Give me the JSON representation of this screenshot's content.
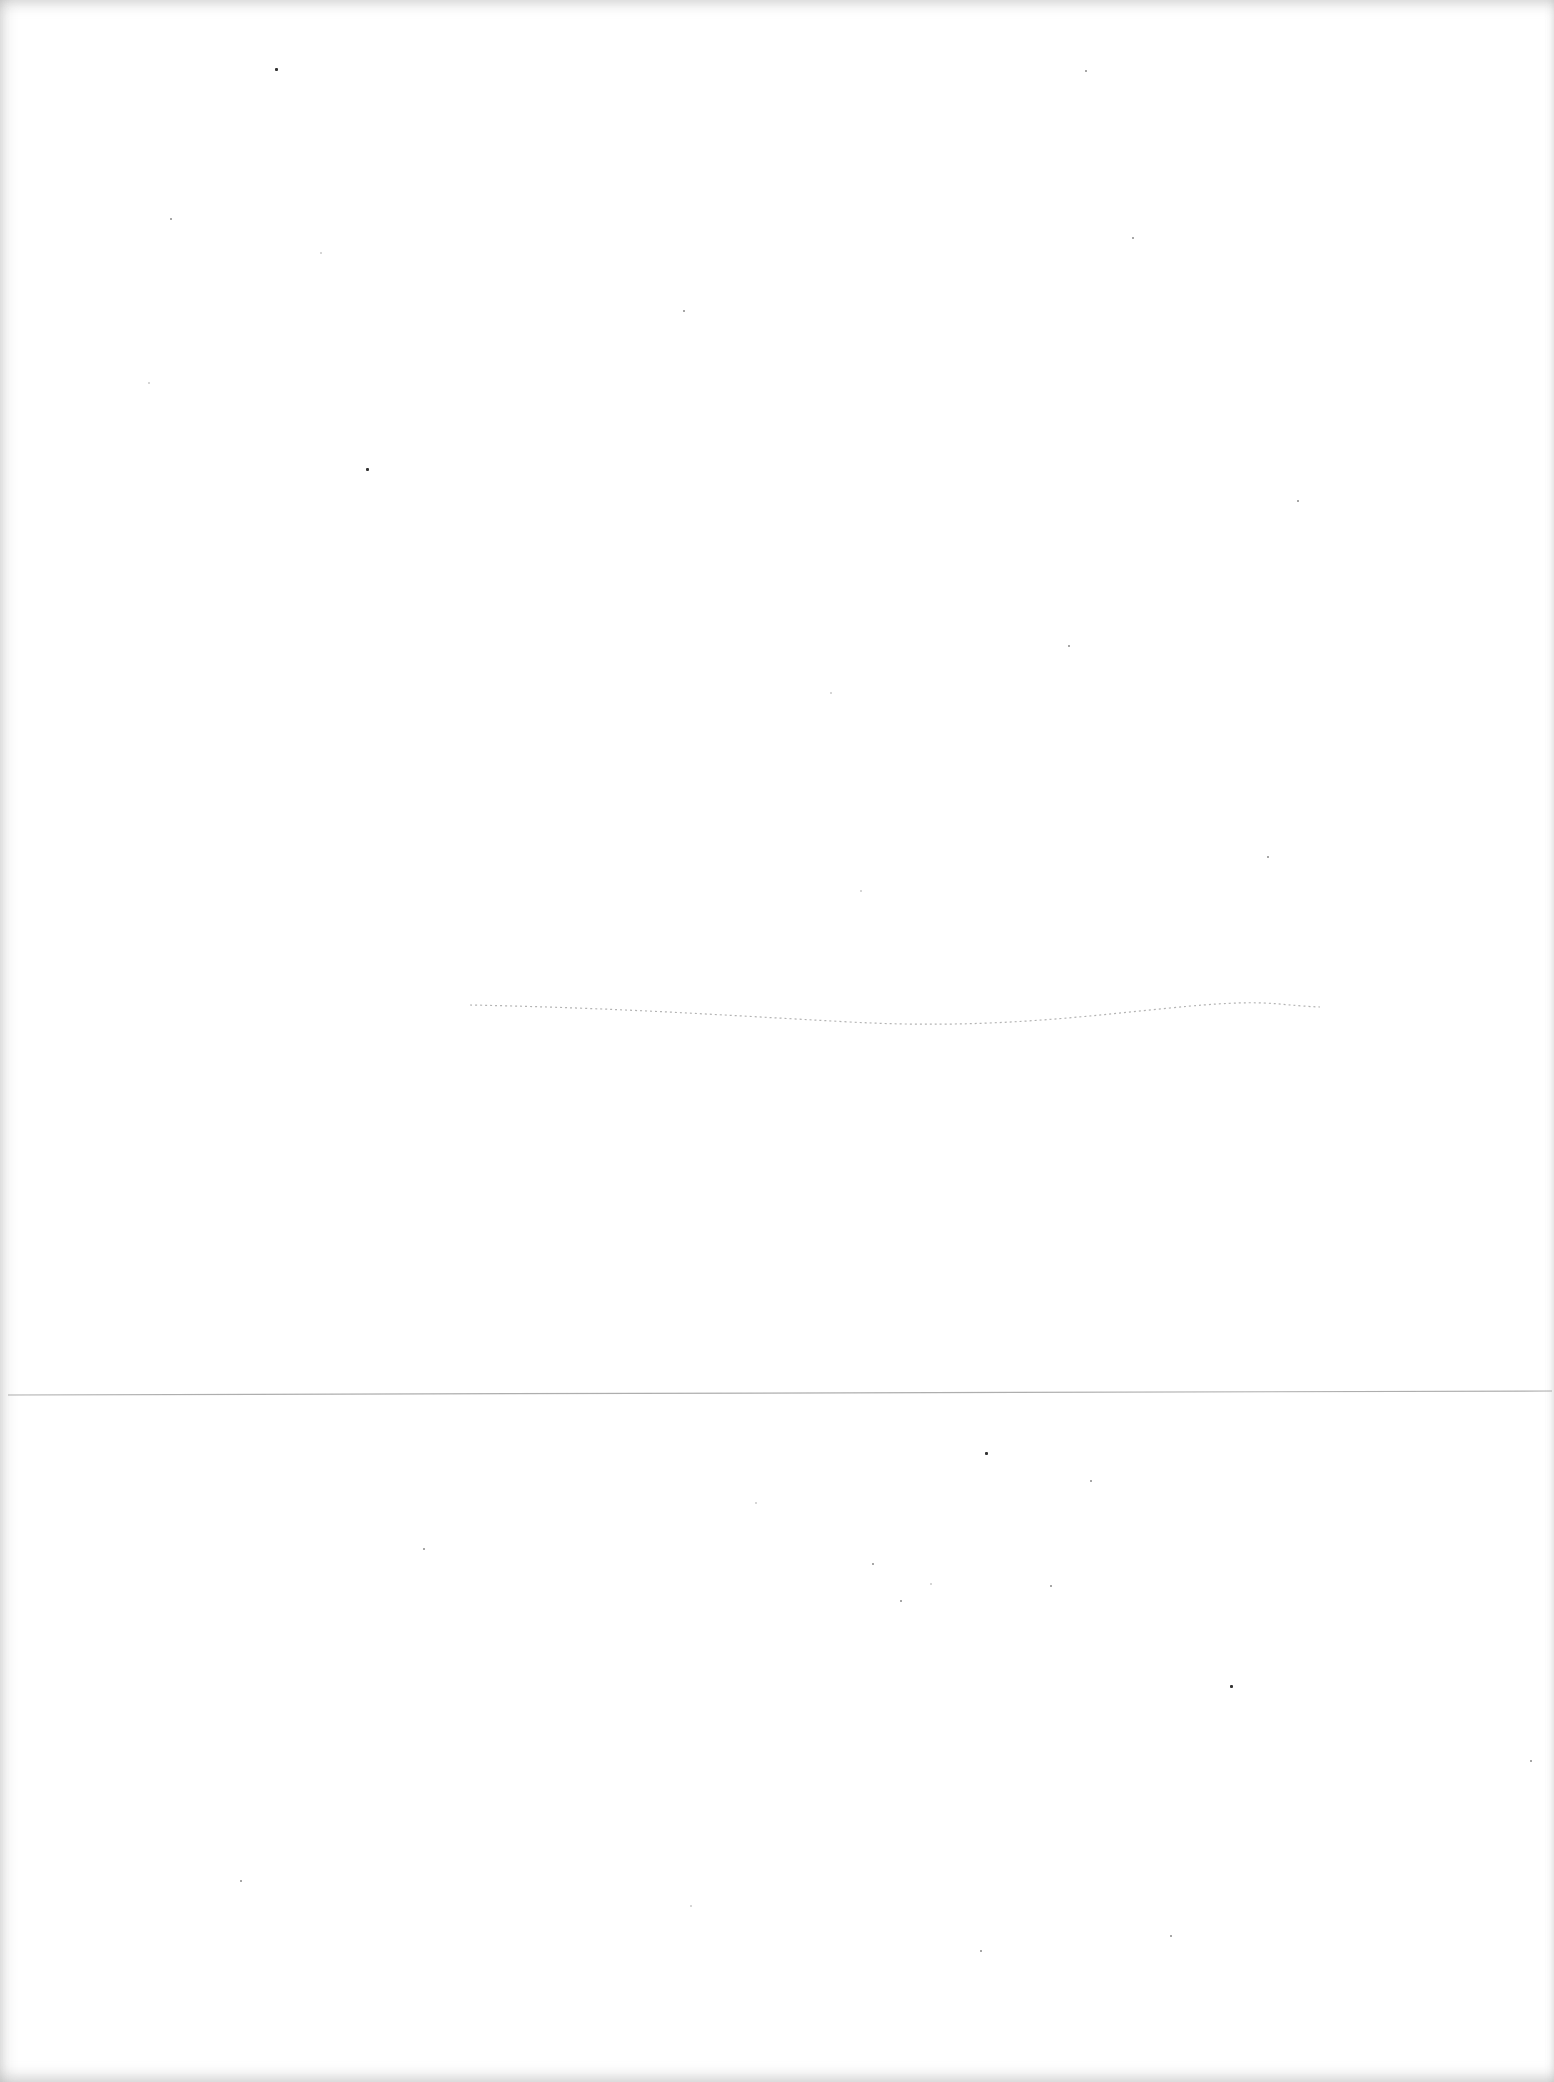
{
  "page": {
    "type": "scanned-blank-page",
    "visible_text": "",
    "background_color": "#ffffff",
    "line_color": "#9a9a9a",
    "speck_color": "#8a8a8a"
  },
  "marks": {
    "faint_curve": "faint dotted pencil curve",
    "fold_line": "horizontal fold line"
  },
  "specks": [
    [
      275,
      68
    ],
    [
      1085,
      70
    ],
    [
      170,
      218
    ],
    [
      320,
      252
    ],
    [
      683,
      310
    ],
    [
      1132,
      237
    ],
    [
      148,
      382
    ],
    [
      366,
      468
    ],
    [
      1297,
      500
    ],
    [
      830,
      692
    ],
    [
      1068,
      645
    ],
    [
      1267,
      856
    ],
    [
      860,
      890
    ],
    [
      1090,
      1480
    ],
    [
      985,
      1452
    ],
    [
      755,
      1502
    ],
    [
      423,
      1548
    ],
    [
      872,
      1563
    ],
    [
      930,
      1583
    ],
    [
      1050,
      1585
    ],
    [
      900,
      1600
    ],
    [
      1230,
      1685
    ],
    [
      1530,
      1760
    ],
    [
      1170,
      1935
    ],
    [
      690,
      1905
    ],
    [
      240,
      1880
    ],
    [
      980,
      1950
    ]
  ]
}
